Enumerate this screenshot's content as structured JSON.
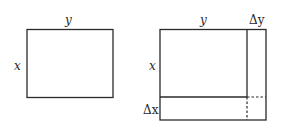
{
  "diagram": {
    "left_figure": {
      "label_top": "y",
      "label_side": "x"
    },
    "right_figure": {
      "label_top": "y",
      "label_top_increment": "Δy",
      "label_side": "x",
      "label_side_increment": "Δx"
    },
    "colors": {
      "stroke": "#2a2a2a",
      "background": "#ffffff"
    }
  }
}
